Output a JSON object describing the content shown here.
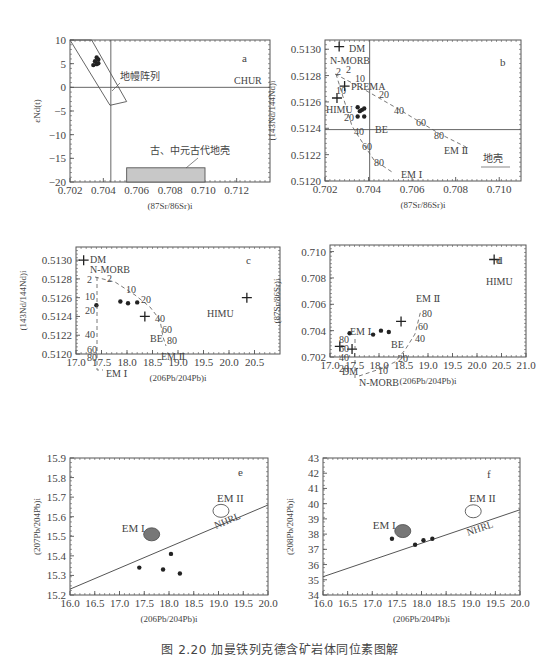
{
  "figure_caption": "图 2.20   加曼铁列克德含矿岩体同位素图解",
  "chart_data": [
    {
      "panel": "a",
      "type": "scatter",
      "xlabel": "(87Sr/86Sr)i",
      "ylabel": "εNd(t)",
      "xlim": [
        0.702,
        0.714
      ],
      "ylim": [
        -20,
        10
      ],
      "xticks": [
        "0.702",
        "0.704",
        "0.706",
        "0.708",
        "0.710",
        "0.712"
      ],
      "yticks": [
        "10",
        "5",
        "0",
        "−5",
        "−10",
        "−15",
        "−20"
      ],
      "reference_lines": [
        {
          "label": "CHUR",
          "orientation": "horizontal",
          "value": 0
        },
        {
          "label": "",
          "orientation": "vertical",
          "value": 0.70445
        }
      ],
      "fields": [
        {
          "label": "地幔阵列",
          "shape": "parallelogram",
          "polygon": [
            [
              0.702,
              10
            ],
            [
              0.7033,
              10
            ],
            [
              0.7054,
              -3
            ],
            [
              0.7044,
              -3.8
            ]
          ]
        },
        {
          "label": "古、中元古代地壳",
          "shape": "rect",
          "x": [
            0.7054,
            0.7101
          ],
          "y": [
            -20,
            -17
          ]
        }
      ],
      "points": [
        {
          "x": 0.7036,
          "y": 6.3
        },
        {
          "x": 0.7037,
          "y": 5.9
        },
        {
          "x": 0.7035,
          "y": 5.5
        },
        {
          "x": 0.7037,
          "y": 5.1
        },
        {
          "x": 0.7034,
          "y": 4.7
        },
        {
          "x": 0.7036,
          "y": 4.9
        }
      ],
      "grid": false
    },
    {
      "panel": "b",
      "type": "scatter",
      "xlabel": "(87Sr/86Sr)i",
      "ylabel": "(143Nd/144Nd)i",
      "xlim": [
        0.702,
        0.711
      ],
      "ylim": [
        0.512,
        0.51307
      ],
      "xticks": [
        "0.702",
        "0.704",
        "0.706",
        "0.708",
        "0.710"
      ],
      "yticks": [
        "0.5130",
        "0.5128",
        "0.5126",
        "0.5124",
        "0.5122",
        "0.5120"
      ],
      "reference_lines": [
        {
          "label": "BE",
          "orientation": "horizontal",
          "value": 0.51239
        },
        {
          "label": "",
          "orientation": "vertical",
          "value": 0.70405
        }
      ],
      "end_members": [
        {
          "label": "DM",
          "x": 0.70265,
          "y": 0.51302
        },
        {
          "label": "N-MORB",
          "x": 0.7025,
          "y": 0.51285
        },
        {
          "label": "PREMA",
          "x": 0.7029,
          "y": 0.51272
        },
        {
          "label": "HIMU",
          "x": 0.70255,
          "y": 0.51263
        },
        {
          "label": "EM II",
          "x": 0.7073,
          "y": 0.51229
        },
        {
          "label": "EM I",
          "x": 0.7052,
          "y": 0.51208
        }
      ],
      "mixing_curves": [
        {
          "name": "N-MORB–EM II",
          "ticks": [
            "2",
            "10",
            "20",
            "40",
            "60",
            "80"
          ]
        },
        {
          "name": "N-MORB–EM I",
          "ticks": [
            "2",
            "10",
            "20",
            "40",
            "60",
            "80"
          ]
        }
      ],
      "annotation": "地壳",
      "points": [
        {
          "x": 0.7035,
          "y": 0.51256
        },
        {
          "x": 0.7037,
          "y": 0.51254
        },
        {
          "x": 0.7038,
          "y": 0.51255
        },
        {
          "x": 0.7036,
          "y": 0.51253
        },
        {
          "x": 0.7035,
          "y": 0.51249
        },
        {
          "x": 0.7038,
          "y": 0.51249
        }
      ],
      "grid": false
    },
    {
      "panel": "c",
      "type": "scatter",
      "xlabel": "(206Pb/204Pb)i",
      "ylabel": "(143Nd/144Nd)i",
      "xlim": [
        17.0,
        21.0
      ],
      "ylim": [
        0.512,
        0.51314
      ],
      "xticks": [
        "17.0",
        "17.5",
        "18.0",
        "18.5",
        "19.0",
        "19.5",
        "20.0",
        "20.5"
      ],
      "yticks": [
        "0.5130",
        "0.5128",
        "0.5126",
        "0.5124",
        "0.5122",
        "0.5120"
      ],
      "end_members": [
        {
          "label": "DM",
          "x": 17.15,
          "y": 0.513
        },
        {
          "label": "N-MORB",
          "x": 17.5,
          "y": 0.51287
        },
        {
          "label": "BE",
          "x": 18.35,
          "y": 0.5124
        },
        {
          "label": "EM II",
          "x": 18.7,
          "y": 0.51234
        },
        {
          "label": "EM I",
          "x": 17.45,
          "y": 0.51207
        },
        {
          "label": "HIMU",
          "x": 20.35,
          "y": 0.5126
        }
      ],
      "mixing_curves": [
        {
          "name": "N-MORB–EM II",
          "ticks": [
            "2",
            "10",
            "20",
            "40",
            "60",
            "80"
          ]
        },
        {
          "name": "N-MORB–EM I",
          "ticks": [
            "2",
            "10",
            "20",
            "40",
            "60",
            "80"
          ]
        }
      ],
      "points": [
        {
          "x": 17.4,
          "y": 0.51252
        },
        {
          "x": 17.87,
          "y": 0.51256
        },
        {
          "x": 18.02,
          "y": 0.51254
        },
        {
          "x": 18.2,
          "y": 0.51255
        }
      ],
      "grid": false
    },
    {
      "panel": "d",
      "type": "scatter",
      "xlabel": "(206Pb/204Pb)i",
      "ylabel": "(87Sr/86Sr)i",
      "xlim": [
        17.0,
        21.0
      ],
      "ylim": [
        0.702,
        0.7105
      ],
      "xticks": [
        "17.0",
        "17.5",
        "18.0",
        "18.5",
        "19.0",
        "19.5",
        "20.0",
        "20.5",
        "21.0"
      ],
      "yticks": [
        "0.710",
        "0.708",
        "0.706",
        "0.704",
        "0.702"
      ],
      "end_members": [
        {
          "label": "DM",
          "x": 17.2,
          "y": 0.7028
        },
        {
          "label": "N-MORB",
          "x": 17.45,
          "y": 0.7026
        },
        {
          "label": "BE",
          "x": 18.45,
          "y": 0.7047
        },
        {
          "label": "EM I",
          "x": 17.45,
          "y": 0.7049
        },
        {
          "label": "EM II",
          "x": 18.7,
          "y": 0.7074
        },
        {
          "label": "HIMU",
          "x": 20.35,
          "y": 0.7094
        }
      ],
      "mixing_curves": [
        {
          "name": "N-MORB–EM II",
          "ticks": [
            "10",
            "20",
            "40",
            "60",
            "80"
          ]
        },
        {
          "name": "DM–EM I",
          "ticks": [
            "20",
            "40",
            "60",
            "80"
          ]
        }
      ],
      "points": [
        {
          "x": 17.4,
          "y": 0.7038
        },
        {
          "x": 17.88,
          "y": 0.7037
        },
        {
          "x": 18.04,
          "y": 0.704
        },
        {
          "x": 18.2,
          "y": 0.7039
        }
      ],
      "grid": false
    },
    {
      "panel": "e",
      "type": "scatter",
      "xlabel": "(206Pb/204Pb)i",
      "ylabel": "(207Pb/204Pb)i",
      "xlim": [
        16.0,
        20.0
      ],
      "ylim": [
        15.2,
        15.9
      ],
      "xticks": [
        "16.0",
        "16.5",
        "17.0",
        "17.5",
        "18.0",
        "18.5",
        "19.0",
        "19.5",
        "20.0"
      ],
      "yticks": [
        "15.9",
        "15.8",
        "15.7",
        "15.6",
        "15.5",
        "15.4",
        "15.3",
        "15.2"
      ],
      "reference_lines": [
        {
          "label": "NHRL",
          "from": [
            16.0,
            15.23
          ],
          "to": [
            20.0,
            15.66
          ]
        }
      ],
      "fields": [
        {
          "label": "EM I",
          "shape": "ellipse",
          "fill": "#777777",
          "cx": 17.65,
          "cy": 15.51
        },
        {
          "label": "EM II",
          "shape": "ellipse",
          "fill": "none",
          "cx": 19.05,
          "cy": 15.63
        }
      ],
      "points": [
        {
          "x": 17.4,
          "y": 15.34
        },
        {
          "x": 17.88,
          "y": 15.33
        },
        {
          "x": 18.04,
          "y": 15.41
        },
        {
          "x": 18.22,
          "y": 15.31
        }
      ],
      "grid": false
    },
    {
      "panel": "f",
      "type": "scatter",
      "xlabel": "(206Pb/204Pb)i",
      "ylabel": "(208Pb/204Pb)i",
      "xlim": [
        16.0,
        20.0
      ],
      "ylim": [
        34,
        43
      ],
      "xticks": [
        "16.0",
        "16.5",
        "17.0",
        "17.5",
        "18.0",
        "18.5",
        "19.0",
        "19.5",
        "20.0"
      ],
      "yticks": [
        "43",
        "42",
        "41",
        "40",
        "39",
        "38",
        "37",
        "36",
        "35",
        "34"
      ],
      "reference_lines": [
        {
          "label": "NHRL",
          "from": [
            16.0,
            35.2
          ],
          "to": [
            20.0,
            39.6
          ]
        }
      ],
      "fields": [
        {
          "label": "EM I",
          "shape": "ellipse",
          "fill": "#777777",
          "cx": 17.62,
          "cy": 38.2
        },
        {
          "label": "EM II",
          "shape": "ellipse",
          "fill": "none",
          "cx": 19.05,
          "cy": 39.5
        }
      ],
      "points": [
        {
          "x": 17.4,
          "y": 37.7
        },
        {
          "x": 17.87,
          "y": 37.3
        },
        {
          "x": 18.04,
          "y": 37.6
        },
        {
          "x": 18.22,
          "y": 37.7
        }
      ],
      "grid": false
    }
  ],
  "labels": {
    "a": {
      "panel": "a",
      "chur": "CHUR",
      "mantle": "地幔阵列",
      "crust": "古、中元古代地壳"
    },
    "b": {
      "panel": "b",
      "crust": "地壳"
    },
    "c": {
      "panel": "c"
    },
    "d": {
      "panel": "d"
    },
    "e": {
      "panel": "e"
    },
    "f": {
      "panel": "f"
    }
  }
}
